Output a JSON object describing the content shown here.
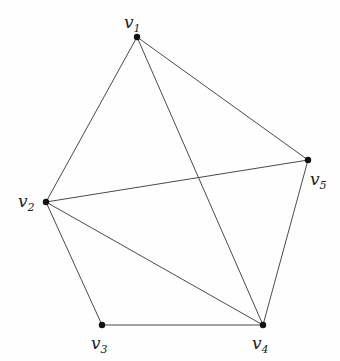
{
  "diagram": {
    "type": "graph",
    "vertices": [
      {
        "id": "v1",
        "name": "v",
        "sub": "1",
        "x": 137,
        "y": 37,
        "lx": 124,
        "ly": 28
      },
      {
        "id": "v2",
        "name": "v",
        "sub": "2",
        "x": 46,
        "y": 202,
        "lx": 18,
        "ly": 207
      },
      {
        "id": "v3",
        "name": "v",
        "sub": "3",
        "x": 102,
        "y": 325,
        "lx": 91,
        "ly": 349
      },
      {
        "id": "v4",
        "name": "v",
        "sub": "4",
        "x": 263,
        "y": 325,
        "lx": 252,
        "ly": 349
      },
      {
        "id": "v5",
        "name": "v",
        "sub": "5",
        "x": 308,
        "y": 160,
        "lx": 310,
        "ly": 185
      }
    ],
    "edges": [
      [
        "v1",
        "v2"
      ],
      [
        "v1",
        "v4"
      ],
      [
        "v1",
        "v5"
      ],
      [
        "v2",
        "v5"
      ],
      [
        "v2",
        "v3"
      ],
      [
        "v2",
        "v4"
      ],
      [
        "v3",
        "v4"
      ],
      [
        "v4",
        "v5"
      ]
    ]
  }
}
